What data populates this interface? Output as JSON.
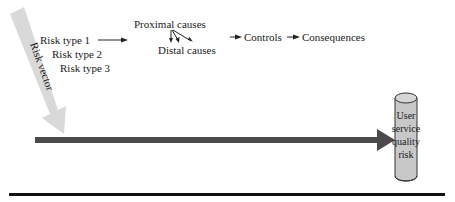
{
  "diagram": {
    "risk_vector": {
      "label": "Risk vector",
      "color": "#d8d8d8"
    },
    "risk_types": [
      "Risk type 1",
      "Risk type 2",
      "Risk type 3"
    ],
    "flow": {
      "proximal": "Proximal causes",
      "distal": "Distal causes",
      "controls": "Controls",
      "consequences": "Consequences"
    },
    "target": {
      "lines": [
        "User",
        "service",
        "quality",
        "risk"
      ],
      "fill": "#c8c8c8"
    },
    "main_arrow_color": "#4a4a4a",
    "baseline_color": "#111111"
  }
}
